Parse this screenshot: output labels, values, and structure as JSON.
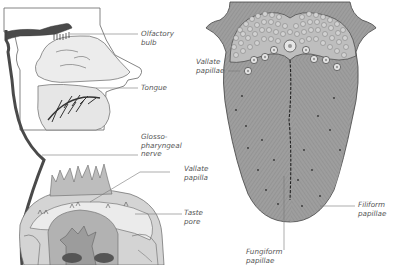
{
  "diagram": {
    "colors": {
      "nerve": "#4a4a4a",
      "head_fill": "#ececec",
      "line": "#555555",
      "tongue_fill": "#9a9a9a",
      "papilla_fill": "#c9c9c9",
      "label_text": "#555555"
    },
    "labels": {
      "olfactory_bulb": {
        "line1": "Olfactory",
        "line2": "bulb"
      },
      "tongue": {
        "line1": "Tongue"
      },
      "glossopharyngeal_nerve": {
        "line1": "Glosso-",
        "line2": "pharyngeal",
        "line3": "nerve"
      },
      "vallate_papilla": {
        "line1": "Vallate",
        "line2": "papilla"
      },
      "taste_pore": {
        "line1": "Taste",
        "line2": "pore"
      },
      "vallate_papillae": {
        "line1": "Vallate",
        "line2": "papillae"
      },
      "filiform_papillae": {
        "line1": "Filiform",
        "line2": "papillae"
      },
      "fungiform_papillae": {
        "line1": "Fungiform",
        "line2": "papillae"
      }
    },
    "panels": [
      {
        "name": "head-sagittal-section",
        "description": "Side view of head showing olfactory bulb, nasal cavity, tongue and glossopharyngeal nerve"
      },
      {
        "name": "vallate-papilla-cross-section",
        "description": "Magnified cross-section of a vallate papilla with taste buds"
      },
      {
        "name": "tongue-surface-view",
        "description": "Dorsal view of tongue with vallate, filiform and fungiform papillae"
      }
    ]
  }
}
